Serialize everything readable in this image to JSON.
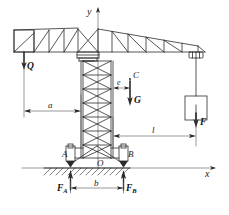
{
  "diagram": {
    "axes": {
      "y_label": "y",
      "x_label": "x",
      "origin_label": "O"
    },
    "points": {
      "support_left": "A",
      "support_right": "B",
      "center_of_gravity": "C"
    },
    "forces": [
      {
        "name": "counterweight-force",
        "label": "Q",
        "direction": "down"
      },
      {
        "name": "self-weight-force",
        "label": "G",
        "direction": "down"
      },
      {
        "name": "load-force",
        "label": "F",
        "direction": "down"
      },
      {
        "name": "reaction-a",
        "label": "F",
        "sub": "A",
        "direction": "up"
      },
      {
        "name": "reaction-b",
        "label": "F",
        "sub": "B",
        "direction": "up"
      }
    ],
    "dimensions": [
      {
        "name": "dim-a",
        "label": "a"
      },
      {
        "name": "dim-e",
        "label": "e"
      },
      {
        "name": "dim-l",
        "label": "l"
      },
      {
        "name": "dim-b",
        "label": "b"
      }
    ],
    "colors": {
      "line": "#2b2b2b",
      "thin": "#555555",
      "background": "#ffffff",
      "text": "#1a1a1a"
    }
  }
}
